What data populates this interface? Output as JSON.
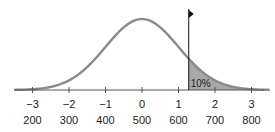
{
  "chart_data": {
    "type": "area",
    "title": "",
    "xlabel": "",
    "ylabel": "",
    "distribution": {
      "mean_z": 0,
      "sd_z": 1,
      "mean_score": 500,
      "sd_score": 100
    },
    "x_range": [
      -3.5,
      3.5
    ],
    "z_ticks": [
      "−3",
      "−2",
      "−1",
      "0",
      "1",
      "2",
      "3"
    ],
    "score_ticks": [
      "200",
      "300",
      "400",
      "500",
      "600",
      "700",
      "800"
    ],
    "tick_values": [
      -3,
      -2,
      -1,
      0,
      1,
      2,
      3
    ],
    "cutoff": {
      "z": 1.28,
      "score": 628,
      "marker": "flag"
    },
    "shaded_region": {
      "from_z": 1.28,
      "to_z": 3.5,
      "label": "10%",
      "percent": 10
    },
    "grid": false,
    "legend": null
  },
  "colors": {
    "curve": "#8a8a8a",
    "shade": "#a8a8a8",
    "axis": "#555555",
    "flag": "#111111"
  }
}
